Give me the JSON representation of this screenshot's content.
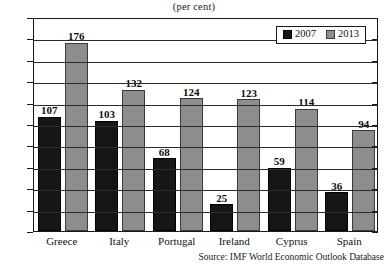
{
  "title": "(per cent)",
  "source": "Source: IMF World Economic Outlook Database",
  "legend": {
    "items": [
      {
        "label": "2007",
        "color": "#161616",
        "swatch": "legend-swatch-2007"
      },
      {
        "label": "2013",
        "color": "#8d8d8d",
        "swatch": "legend-swatch-2013"
      }
    ]
  },
  "axis": {
    "y_ticks": [
      "0",
      "20",
      "40",
      "60",
      "80",
      "100",
      "120",
      "140",
      "160",
      "180",
      "200"
    ]
  },
  "chart_data": {
    "type": "bar",
    "title": "(per cent)",
    "xlabel": "",
    "ylabel": "(per cent)",
    "ylim": [
      0,
      200
    ],
    "ytick_step": 20,
    "grid": true,
    "legend_position": "top-right",
    "categories": [
      "Greece",
      "Italy",
      "Portugal",
      "Ireland",
      "Cyprus",
      "Spain"
    ],
    "series": [
      {
        "name": "2007",
        "color": "#161616",
        "values": [
          107,
          103,
          68,
          25,
          59,
          36
        ]
      },
      {
        "name": "2013",
        "color": "#8d8d8d",
        "values": [
          176,
          132,
          124,
          123,
          114,
          94
        ]
      }
    ],
    "annotations": [
      "Source: IMF World Economic Outlook Database"
    ]
  }
}
